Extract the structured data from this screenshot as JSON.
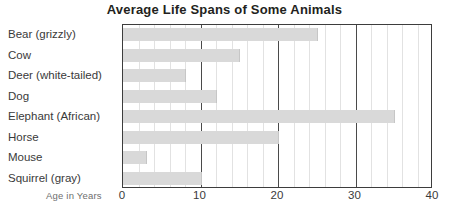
{
  "chart_data": {
    "type": "bar",
    "orientation": "horizontal",
    "title": "Average Life Spans of Some Animals",
    "xlabel": "Age in Years",
    "ylabel": "",
    "categories": [
      "Bear (grizzly)",
      "Cow",
      "Deer (white-tailed)",
      "Dog",
      "Elephant (African)",
      "Horse",
      "Mouse",
      "Squirrel (gray)"
    ],
    "values": [
      25,
      15,
      8,
      12,
      35,
      20,
      3,
      10
    ],
    "xlim": [
      0,
      40
    ],
    "xticks": [
      0,
      10,
      20,
      30,
      40
    ],
    "xtick_labels": [
      "0",
      "10",
      "20",
      "30",
      "40"
    ],
    "minor_tick_step": 2,
    "grid": true,
    "legend": null,
    "bar_color": "#d9d9d9",
    "frame_color": "#3d3d3d",
    "major_gridline_color": "#4a4a4a",
    "minor_gridline_color": "#e2e2e2"
  }
}
